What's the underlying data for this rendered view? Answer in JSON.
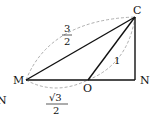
{
  "diagram": {
    "points": {
      "M": {
        "label": "M",
        "x": 26,
        "y": 80
      },
      "O": {
        "label": "O",
        "x": 88,
        "y": 80
      },
      "N": {
        "label": "N",
        "x": 135,
        "y": 80
      },
      "C": {
        "label": "C",
        "x": 135,
        "y": 17
      }
    },
    "stray_label": "N",
    "segments": [
      {
        "from": "M",
        "to": "N",
        "style": "solid"
      },
      {
        "from": "M",
        "to": "C",
        "style": "solid"
      },
      {
        "from": "O",
        "to": "C",
        "style": "solid"
      },
      {
        "from": "C",
        "to": "N",
        "style": "solid"
      }
    ],
    "dimension_labels": {
      "MC": {
        "numerator": "3",
        "denominator": "2",
        "style": "dashed-arc"
      },
      "OC": {
        "value": "1",
        "style": "dashed-arc"
      },
      "MO": {
        "numerator": "√3",
        "denominator": "2",
        "style": "dashed-arc"
      }
    },
    "colors": {
      "line": "#111111",
      "dashed": "#999999"
    }
  }
}
